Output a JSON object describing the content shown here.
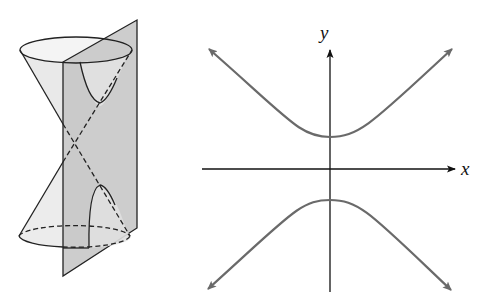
{
  "figure": {
    "left_panel": {
      "description": "Double cone intersected by a vertical plane parallel to the axis, producing a hyperbola",
      "plane_color": "#c9c9c9",
      "cone_fill": "#e6e6e6",
      "line_color": "#222222"
    },
    "right_panel": {
      "description": "Graph of a hyperbola opening up and down",
      "x_axis_label": "x",
      "y_axis_label": "y",
      "curve_color": "#6a6a6a",
      "axis_color": "#111111"
    }
  }
}
